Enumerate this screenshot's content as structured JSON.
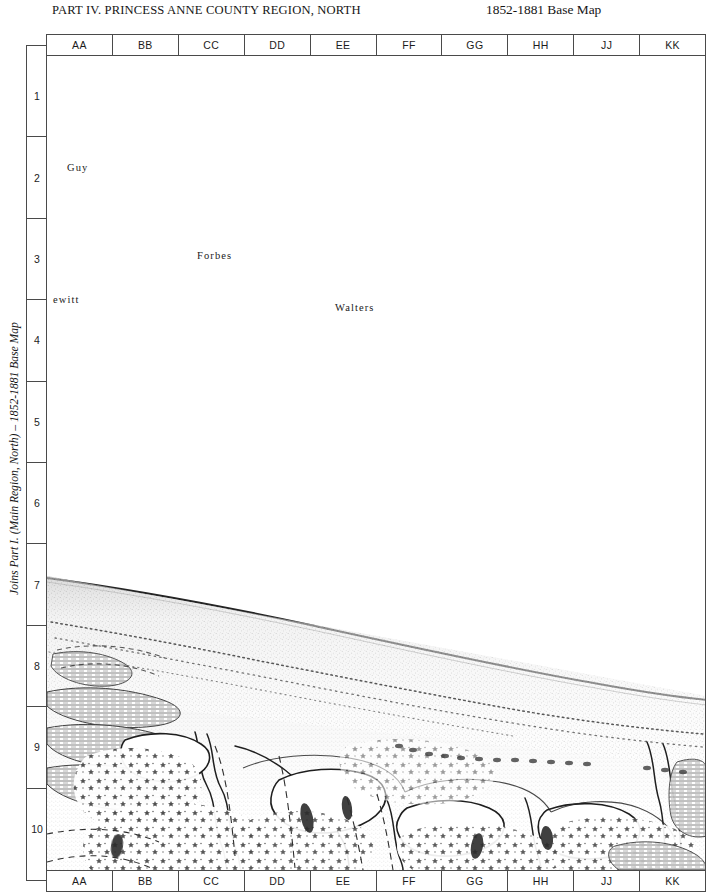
{
  "header": {
    "title": "PART IV. PRINCESS ANNE COUNTY REGION, NORTH",
    "base_map_label": "1852-1881 Base Map"
  },
  "side_label": {
    "text": "Joins Part I. (Main Region, North) – 1852-1881 Base Map"
  },
  "grid": {
    "columns": [
      "AA",
      "BB",
      "CC",
      "DD",
      "EE",
      "FF",
      "GG",
      "HH",
      "JJ",
      "KK"
    ],
    "rows": [
      "1",
      "2",
      "3",
      "4",
      "5",
      "6",
      "7",
      "8",
      "9",
      "10"
    ]
  },
  "map": {
    "place_labels": [
      {
        "name": "Guy",
        "text": "Guy",
        "x": 40,
        "y": 640
      },
      {
        "name": "Forbes",
        "text": "Forbes",
        "x": 148,
        "y": 740
      },
      {
        "name": "Walters",
        "text": "Walters",
        "x": 286,
        "y": 786
      },
      {
        "name": "ewitt",
        "text": "ewitt",
        "x": 6,
        "y": 781
      }
    ],
    "ink_color": "#3a3a3a",
    "paper_color": "#ffffff"
  }
}
